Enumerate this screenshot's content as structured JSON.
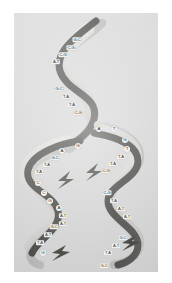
{
  "figure": {
    "panel_background_color": "#d6d6d6",
    "page_background_color": "#ffffff",
    "ribbon_dark_color": "#3a3a38",
    "ribbon_light_color": "#b9b9b7",
    "label_text_color": "#30302e",
    "label_background_color": "#f3f2ee"
  },
  "parent_helix": {
    "name": "parent-duplex",
    "base_pairs": [
      {
        "id": "p1",
        "label": "G-C",
        "x": 63,
        "y": 27
      },
      {
        "id": "p2",
        "label": "C-G",
        "x": 57,
        "y": 35
      },
      {
        "id": "p3",
        "label": "C-G",
        "x": 49,
        "y": 42
      },
      {
        "id": "p4",
        "label": "A-T",
        "x": 42,
        "y": 49
      },
      {
        "id": "p5",
        "label": "G-C",
        "x": 45,
        "y": 76
      },
      {
        "id": "p6",
        "label": "T-A",
        "x": 52,
        "y": 84
      },
      {
        "id": "p7",
        "label": "T-A",
        "x": 58,
        "y": 92
      },
      {
        "id": "p8",
        "label": "C-G",
        "x": 64,
        "y": 100
      }
    ]
  },
  "replication_fork": {
    "name": "unpaired-bases-at-fork",
    "bases": [
      {
        "id": "f1",
        "label": "A",
        "x": 85,
        "y": 116
      },
      {
        "id": "f2",
        "label": "T",
        "x": 100,
        "y": 116
      },
      {
        "id": "f3",
        "label": "G",
        "x": 111,
        "y": 127
      },
      {
        "id": "f4",
        "label": "T",
        "x": 113,
        "y": 136
      },
      {
        "id": "f5",
        "label": "G",
        "x": 64,
        "y": 133
      },
      {
        "id": "f6",
        "label": "A",
        "x": 48,
        "y": 138
      }
    ]
  },
  "daughter_left": {
    "name": "left-daughter-strand",
    "base_pairs": [
      {
        "id": "l1",
        "label": "G-C",
        "x": 41,
        "y": 145
      },
      {
        "id": "l2",
        "label": "T-A",
        "x": 33,
        "y": 152
      },
      {
        "id": "l3",
        "label": "T-A",
        "x": 25,
        "y": 159
      },
      {
        "id": "l4",
        "label": "G-C",
        "x": 40,
        "y": 214
      },
      {
        "id": "l5",
        "label": "A-T",
        "x": 34,
        "y": 222
      },
      {
        "id": "l6",
        "label": "T-A",
        "x": 26,
        "y": 230
      }
    ],
    "bases": [
      {
        "id": "l7",
        "label": "C",
        "x": 24,
        "y": 170
      },
      {
        "id": "l8",
        "label": "C",
        "x": 30,
        "y": 180
      },
      {
        "id": "l9",
        "label": "G",
        "x": 36,
        "y": 188
      },
      {
        "id": "l10",
        "label": "A",
        "x": 45,
        "y": 195
      },
      {
        "id": "l11",
        "label": "G",
        "x": 29,
        "y": 240
      }
    ],
    "inner_pairs": [
      {
        "id": "l12",
        "label": "A-T",
        "x": 49,
        "y": 203
      },
      {
        "id": "l13",
        "label": "A-T",
        "x": 49,
        "y": 211
      }
    ]
  },
  "daughter_right": {
    "name": "right-daughter-strand",
    "base_pairs": [
      {
        "id": "r1",
        "label": "T-A",
        "x": 107,
        "y": 144
      },
      {
        "id": "r2",
        "label": "T-A",
        "x": 99,
        "y": 151
      },
      {
        "id": "r3",
        "label": "C-G",
        "x": 92,
        "y": 158
      },
      {
        "id": "r4",
        "label": "C-G",
        "x": 93,
        "y": 180
      },
      {
        "id": "r5",
        "label": "T-A",
        "x": 100,
        "y": 188
      },
      {
        "id": "r6",
        "label": "A-T",
        "x": 107,
        "y": 196
      },
      {
        "id": "r7",
        "label": "A-T",
        "x": 113,
        "y": 204
      },
      {
        "id": "r8",
        "label": "G-C",
        "x": 109,
        "y": 225
      },
      {
        "id": "r9",
        "label": "A-T",
        "x": 102,
        "y": 233
      },
      {
        "id": "r10",
        "label": "T-A",
        "x": 94,
        "y": 240
      },
      {
        "id": "r11",
        "label": "G-C",
        "x": 90,
        "y": 253
      }
    ]
  }
}
